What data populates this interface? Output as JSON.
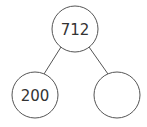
{
  "diagram": {
    "type": "number-bond",
    "colors": {
      "stroke": "#555555",
      "text": "#333333",
      "background": "#ffffff"
    },
    "nodes": {
      "whole": {
        "label": "712"
      },
      "part_left": {
        "label": "200"
      },
      "part_right": {
        "label": ""
      }
    }
  }
}
